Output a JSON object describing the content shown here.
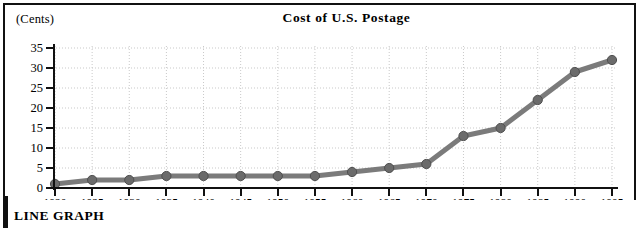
{
  "figure": {
    "units_label": "(Cents)",
    "caption": "LINE GRAPH"
  },
  "chart_data": {
    "type": "line",
    "title": "Cost of U.S. Postage",
    "xlabel": "(Year)",
    "ylabel": "(Cents)",
    "categories": [
      "1920",
      "1925",
      "1930",
      "1935",
      "1940",
      "1945",
      "1950",
      "1955",
      "1960",
      "1965",
      "1970",
      "1975",
      "1980",
      "1985",
      "1990",
      "1995"
    ],
    "values": [
      1,
      2,
      2,
      3,
      3,
      3,
      3,
      3,
      4,
      5,
      6,
      13,
      15,
      22,
      29,
      32
    ],
    "xlim": [
      1920,
      1995
    ],
    "ylim": [
      0,
      35
    ],
    "yticks": [
      0,
      5,
      10,
      15,
      20,
      25,
      30,
      35
    ],
    "grid": true,
    "legend": "none",
    "line_color": "#7b7b7b",
    "marker_color": "#6b6b6b",
    "grid_color": "#c9c9c9",
    "axis_color": "#111111"
  }
}
